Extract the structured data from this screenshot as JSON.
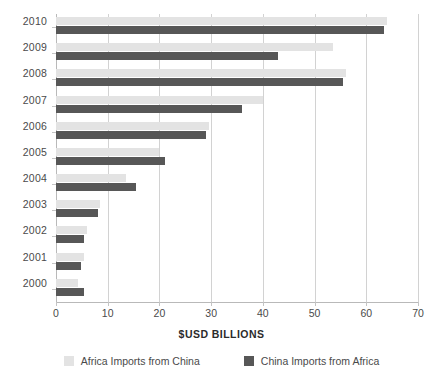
{
  "chart_data": {
    "type": "bar",
    "orientation": "horizontal",
    "title": "",
    "subtitle": "",
    "xlabel": "$USD BILLIONS",
    "ylabel": "",
    "xlim": [
      0,
      70
    ],
    "xticks": [
      0,
      10,
      20,
      30,
      40,
      50,
      60,
      70
    ],
    "xticklabels": [
      "0",
      "10",
      "20",
      "30",
      "40",
      "50",
      "60",
      "70"
    ],
    "grid": "vertical",
    "legend_position": "bottom",
    "categories": [
      "2010",
      "2009",
      "2008",
      "2007",
      "2006",
      "2005",
      "2004",
      "2003",
      "2002",
      "2001",
      "2000"
    ],
    "series": [
      {
        "name": "Africa Imports from China",
        "color": "#e3e3e3",
        "values": [
          64.0,
          53.5,
          56.0,
          40.0,
          29.5,
          20.0,
          13.5,
          8.5,
          6.0,
          5.5,
          4.3
        ]
      },
      {
        "name": "China Imports from Africa",
        "color": "#575757",
        "values": [
          63.5,
          43.0,
          55.5,
          36.0,
          29.0,
          21.0,
          15.5,
          8.2,
          5.5,
          4.8,
          5.4
        ]
      }
    ]
  },
  "axis_title": "$USD BILLIONS",
  "legend": [
    {
      "label": "Africa Imports from China",
      "swatch": "light"
    },
    {
      "label": "China Imports from Africa",
      "swatch": "dark"
    }
  ]
}
